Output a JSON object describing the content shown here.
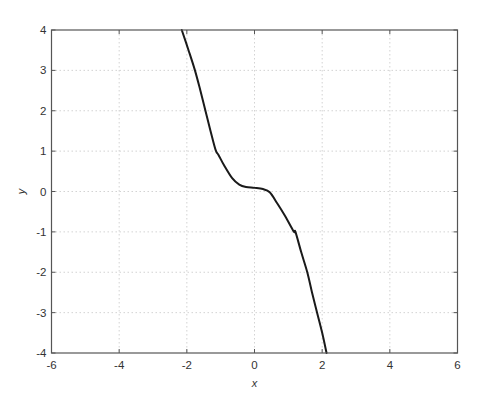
{
  "chart_data": {
    "type": "line",
    "title": "",
    "xlabel": "x",
    "ylabel": "y",
    "xlim": [
      -6,
      6
    ],
    "ylim": [
      -4,
      4
    ],
    "xticks": [
      -6,
      -4,
      -2,
      0,
      2,
      4,
      6
    ],
    "yticks": [
      -4,
      -3,
      -2,
      -1,
      0,
      1,
      2,
      3,
      4
    ],
    "xtick_labels": [
      "-6",
      "-4",
      "-2",
      "0",
      "2",
      "4",
      "6"
    ],
    "ytick_labels": [
      "-4",
      "-3",
      "-2",
      "-1",
      "0",
      "1",
      "2",
      "3",
      "4"
    ],
    "grid": true,
    "legend": null,
    "series": [
      {
        "name": "curve",
        "color": "#1a1a1a",
        "x": [
          -2.15,
          -1.95,
          -1.76,
          -1.6,
          -1.45,
          -1.3,
          -1.15,
          -1.06,
          -0.9,
          -0.66,
          -0.45,
          -0.25,
          0.0,
          0.25,
          0.45,
          0.67,
          0.9,
          1.16,
          1.21,
          1.38,
          1.56,
          1.7,
          1.85,
          2.0,
          2.13
        ],
        "y": [
          4.0,
          3.5,
          3.0,
          2.5,
          2.0,
          1.5,
          1.03,
          0.9,
          0.65,
          0.33,
          0.17,
          0.11,
          0.09,
          0.06,
          -0.02,
          -0.29,
          -0.6,
          -0.99,
          -1.0,
          -1.5,
          -2.0,
          -2.5,
          -3.0,
          -3.5,
          -4.0
        ]
      }
    ]
  },
  "colors": {
    "axis": "#555555",
    "grid": "#c8c8c8",
    "line": "#1a1a1a",
    "background": "#ffffff"
  }
}
